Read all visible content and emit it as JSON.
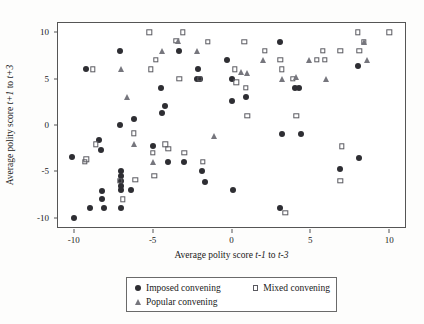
{
  "chart_data": {
    "type": "scatter",
    "title": "",
    "xlabel": "Average polity score t-1 to t-3",
    "ylabel": "Average polity score t+1 to t+3",
    "xlim": [
      -11,
      11
    ],
    "ylim": [
      -11,
      11
    ],
    "xticks": [
      -10,
      -5,
      0,
      5,
      10
    ],
    "yticks": [
      -10,
      -5,
      0,
      5,
      10
    ],
    "xtick_labels": [
      "-10",
      "-5",
      "0",
      "5",
      "10"
    ],
    "ytick_labels": [
      "-10",
      "-5",
      "0",
      "5",
      "10"
    ],
    "grid": false,
    "legend_position": "below-axes",
    "series": [
      {
        "name": "Imposed convening",
        "marker": "circle",
        "color": "#2e2e33",
        "points": [
          [
            -10.0,
            -10.0
          ],
          [
            -10.1,
            -3.4
          ],
          [
            -9.2,
            6.0
          ],
          [
            -9.0,
            -9.0
          ],
          [
            -8.4,
            -1.6
          ],
          [
            -8.3,
            -2.7
          ],
          [
            -8.2,
            -7.1
          ],
          [
            -8.2,
            -8.0
          ],
          [
            -8.1,
            -9.0
          ],
          [
            -7.1,
            8.0
          ],
          [
            -7.1,
            0.0
          ],
          [
            -7.0,
            -5.0
          ],
          [
            -7.0,
            -5.5
          ],
          [
            -7.0,
            -6.0
          ],
          [
            -7.0,
            -6.6
          ],
          [
            -7.0,
            -7.0
          ],
          [
            -7.0,
            -9.0
          ],
          [
            -6.2,
            0.6
          ],
          [
            -6.4,
            -7.0
          ],
          [
            -5.0,
            -2.3
          ],
          [
            -4.5,
            4.0
          ],
          [
            -4.4,
            1.3
          ],
          [
            -4.2,
            2.1
          ],
          [
            -4.0,
            -4.0
          ],
          [
            -3.3,
            8.0
          ],
          [
            -3.0,
            -4.0
          ],
          [
            -2.2,
            5.0
          ],
          [
            -2.1,
            6.0
          ],
          [
            -2.0,
            5.0
          ],
          [
            -1.9,
            -5.0
          ],
          [
            -1.7,
            -6.2
          ],
          [
            -0.3,
            7.0
          ],
          [
            0.0,
            5.0
          ],
          [
            0.0,
            2.6
          ],
          [
            0.1,
            -7.0
          ],
          [
            0.9,
            3.0
          ],
          [
            3.1,
            9.0
          ],
          [
            3.2,
            -1.0
          ],
          [
            3.1,
            -9.0
          ],
          [
            4.0,
            4.0
          ],
          [
            4.3,
            4.0
          ],
          [
            4.4,
            -1.0
          ],
          [
            6.9,
            -4.7
          ],
          [
            8.0,
            6.4
          ],
          [
            8.1,
            -3.6
          ]
        ]
      },
      {
        "name": "Mixed convening",
        "marker": "square-open",
        "color": "#5a5a60",
        "points": [
          [
            -9.3,
            -4.0
          ],
          [
            -9.2,
            -3.7
          ],
          [
            -8.8,
            6.0
          ],
          [
            -8.6,
            -2.1
          ],
          [
            -7.1,
            -6.0
          ],
          [
            -6.9,
            -8.0
          ],
          [
            -6.2,
            -0.9
          ],
          [
            -6.1,
            -5.9
          ],
          [
            -5.2,
            10.0
          ],
          [
            -5.1,
            6.0
          ],
          [
            -5.0,
            -3.0
          ],
          [
            -4.9,
            -5.5
          ],
          [
            -4.8,
            7.0
          ],
          [
            -4.2,
            -2.1
          ],
          [
            -4.0,
            -2.6
          ],
          [
            -3.5,
            9.1
          ],
          [
            -3.3,
            5.0
          ],
          [
            -3.1,
            10.0
          ],
          [
            -3.0,
            -3.0
          ],
          [
            -2.0,
            5.0
          ],
          [
            -1.8,
            -4.0
          ],
          [
            -1.5,
            9.0
          ],
          [
            0.2,
            6.0
          ],
          [
            0.3,
            4.6
          ],
          [
            0.8,
            9.0
          ],
          [
            0.9,
            4.0
          ],
          [
            1.0,
            1.0
          ],
          [
            2.1,
            8.0
          ],
          [
            3.1,
            7.0
          ],
          [
            3.2,
            6.0
          ],
          [
            3.4,
            -9.5
          ],
          [
            3.9,
            5.0
          ],
          [
            4.1,
            1.0
          ],
          [
            5.4,
            7.0
          ],
          [
            5.9,
            7.0
          ],
          [
            5.8,
            8.0
          ],
          [
            6.9,
            8.0
          ],
          [
            7.0,
            -2.3
          ],
          [
            6.9,
            -6.0
          ],
          [
            8.0,
            10.0
          ],
          [
            8.1,
            8.0
          ],
          [
            8.4,
            9.0
          ],
          [
            10.0,
            10.0
          ]
        ]
      },
      {
        "name": "Popular convening",
        "marker": "triangle",
        "color": "#76767d",
        "points": [
          [
            -7.0,
            6.0
          ],
          [
            -6.6,
            3.0
          ],
          [
            -6.2,
            -2.1
          ],
          [
            -5.0,
            -4.0
          ],
          [
            -4.4,
            8.0
          ],
          [
            -3.4,
            9.1
          ],
          [
            -2.2,
            8.0
          ],
          [
            -1.1,
            -1.2
          ],
          [
            0.6,
            5.7
          ],
          [
            1.0,
            5.6
          ],
          [
            2.0,
            7.0
          ],
          [
            3.2,
            5.0
          ],
          [
            4.1,
            5.2
          ],
          [
            4.9,
            7.0
          ],
          [
            6.0,
            5.0
          ],
          [
            8.4,
            9.0
          ],
          [
            8.6,
            7.0
          ]
        ]
      }
    ]
  },
  "legend": {
    "entries": [
      {
        "label": "Imposed convening",
        "marker": "circle"
      },
      {
        "label": "Mixed convening",
        "marker": "square-open"
      },
      {
        "label": "Popular convening",
        "marker": "triangle"
      }
    ]
  }
}
